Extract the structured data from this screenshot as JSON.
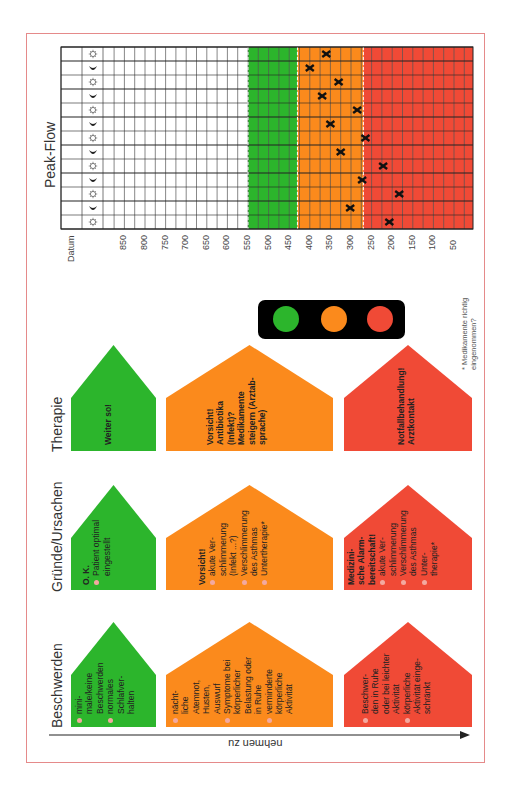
{
  "title": "Peak-Flow",
  "colors": {
    "green": "#2cb52c",
    "orange": "#fb8a1c",
    "red": "#f04a36",
    "frame": "#e58a8a",
    "traffic_light_body": "#000000",
    "bullet": "#f3a9a0"
  },
  "chart_data": {
    "type": "scatter",
    "title": "Peak-Flow",
    "xlabel": "Datum",
    "ylabel": "Peak-Flow",
    "tick_labels": [
      "850",
      "800",
      "750",
      "700",
      "650",
      "600",
      "550",
      "500",
      "450",
      "400",
      "350",
      "300",
      "250",
      "200",
      "150",
      "100",
      "50"
    ],
    "zones": [
      {
        "name": "green",
        "from": 550,
        "to": 430,
        "color": "#2cb52c"
      },
      {
        "name": "orange",
        "from": 430,
        "to": 270,
        "color": "#fb8a1c"
      },
      {
        "name": "red",
        "from": 270,
        "to": 0,
        "color": "#f04a36"
      }
    ],
    "rows": [
      "sun",
      "moon",
      "sun",
      "moon",
      "sun",
      "moon",
      "sun",
      "moon",
      "sun",
      "moon",
      "sun",
      "moon",
      "sun"
    ],
    "values": [
      360,
      400,
      330,
      370,
      285,
      350,
      265,
      325,
      222,
      273,
      183,
      302,
      207
    ],
    "marker": "x",
    "grid": true
  },
  "axis": {
    "datum_label": "Datum",
    "ticks": [
      "850",
      "800",
      "750",
      "700",
      "650",
      "600",
      "550",
      "500",
      "450",
      "400",
      "350",
      "300",
      "250",
      "200",
      "150",
      "100",
      "50"
    ]
  },
  "traffic_light": {
    "lights": [
      "green",
      "orange",
      "red"
    ]
  },
  "footnote": [
    "* Medikamente richtig",
    "eingenommen?"
  ],
  "rows": {
    "therapie": {
      "label": "Therapie",
      "green": {
        "lines": [
          {
            "t": "Weiter so!",
            "bold": true
          }
        ]
      },
      "orange": {
        "lines": [
          {
            "t": "Vorsicht!",
            "bold": true
          },
          {
            "t": "Antibiotika",
            "bold": true
          },
          {
            "t": "(Infekt)?",
            "bold": true
          },
          {
            "t": "Medikamente",
            "bold": true
          },
          {
            "t": "steigern (Arztab-",
            "bold": true
          },
          {
            "t": "sprache)",
            "bold": true
          }
        ]
      },
      "red": {
        "lines": [
          {
            "t": "Notfallbehandlung!",
            "bold": true
          },
          {
            "t": "Arztkontakt",
            "bold": true
          }
        ]
      }
    },
    "gruende": {
      "label": "Gründe/Ursachen",
      "green": {
        "header": "O. K.",
        "items": [
          [
            "Patient optimal",
            "eingestellt"
          ]
        ]
      },
      "orange": {
        "header": "Vorsicht!",
        "items": [
          [
            "akute Ver-",
            "schlimmerung",
            "(Infekt ...?)"
          ],
          [
            "Verschlimmerung",
            "des Asthmas"
          ],
          [
            "Untertherapie*"
          ]
        ]
      },
      "red": {
        "header_lines": [
          "Medizini-",
          "sche Alarm-",
          "bereitschaft!"
        ],
        "items": [
          [
            "akute Ver-",
            "schlimmerung"
          ],
          [
            "Verschlimmerung",
            "des Asthmas"
          ],
          [
            "Unter-",
            "therapie*"
          ]
        ]
      }
    },
    "beschwerden": {
      "label": "Beschwerden",
      "green": {
        "items": [
          [
            "mini-",
            "male/keine",
            "Beschwerden"
          ],
          [
            "normales",
            "Schlafver-",
            "halten"
          ]
        ]
      },
      "orange": {
        "items": [
          [
            "nächt-",
            "liche",
            "Atemnot,",
            "Husten,",
            "Auswurf"
          ],
          [
            "Symptome bei",
            "körperlicher",
            "Belastung oder",
            "in Ruhe"
          ],
          [
            "verminderte",
            "körperliche",
            "Aktivität"
          ]
        ]
      },
      "red": {
        "items": [
          [
            "Beschwer-",
            "den in Ruhe",
            "oder bei leichter",
            "Aktivität"
          ],
          [
            "körperliche",
            "Aktivität einge-",
            "schränkt"
          ]
        ]
      }
    }
  },
  "arrow": {
    "label": "nehmen zu"
  }
}
